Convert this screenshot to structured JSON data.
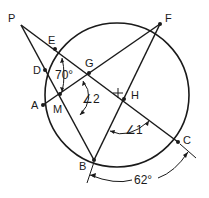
{
  "diagram": {
    "type": "circle-geometry",
    "colors": {
      "stroke": "#1a1a1a",
      "background": "#ffffff"
    },
    "circle": {
      "cx": 117,
      "cy": 95,
      "r": 72
    },
    "points": {
      "P": "P",
      "E": "E",
      "D": "D",
      "G": "G",
      "A": "A",
      "M": "M",
      "H": "H",
      "F": "F",
      "B": "B",
      "C": "C"
    },
    "angles": {
      "angle_at_E": "70°",
      "angle_2": "∠2",
      "angle_1": "∠1",
      "arc_BC": "62°"
    },
    "center_marker": "+"
  }
}
